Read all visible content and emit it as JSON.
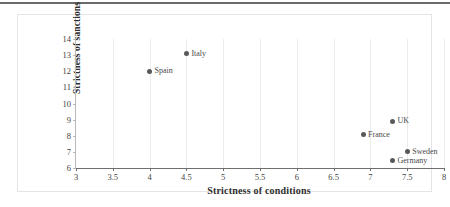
{
  "chart_data": {
    "type": "scatter",
    "title": "",
    "xlabel": "Strictness of conditions",
    "ylabel": "Strictness of sanctions",
    "xlim": [
      3,
      8
    ],
    "ylim": [
      6,
      14
    ],
    "xticks": [
      "3",
      "3.5",
      "4",
      "4.5",
      "5",
      "5.5",
      "6",
      "6.5",
      "7",
      "7.5",
      "8"
    ],
    "xtick_values": [
      3,
      3.5,
      4,
      4.5,
      5,
      5.5,
      6,
      6.5,
      7,
      7.5,
      8
    ],
    "yticks": [
      "14",
      "13",
      "12",
      "11",
      "10",
      "9",
      "8",
      "7",
      "6"
    ],
    "ytick_values": [
      14,
      13,
      12,
      11,
      10,
      9,
      8,
      7,
      6
    ],
    "grid": "vertical",
    "legend": "none",
    "marker_color": "#595959",
    "points": [
      {
        "label": "Italy",
        "x": 4.5,
        "y": 13.1,
        "label_side": "right"
      },
      {
        "label": "Spain",
        "x": 4.0,
        "y": 12.0,
        "label_side": "right"
      },
      {
        "label": "UK",
        "x": 7.3,
        "y": 8.9,
        "label_side": "right"
      },
      {
        "label": "France",
        "x": 6.9,
        "y": 8.05,
        "label_side": "right"
      },
      {
        "label": "Sweden",
        "x": 7.5,
        "y": 7.0,
        "label_side": "right"
      },
      {
        "label": "Germany",
        "x": 7.3,
        "y": 6.45,
        "label_side": "right"
      }
    ]
  },
  "figure": {
    "top_rule_color": "#6b6b6b",
    "frame_color": "#e4e4e4",
    "gridline_color": "#ececec",
    "axis_color": "#6f6f6f"
  }
}
